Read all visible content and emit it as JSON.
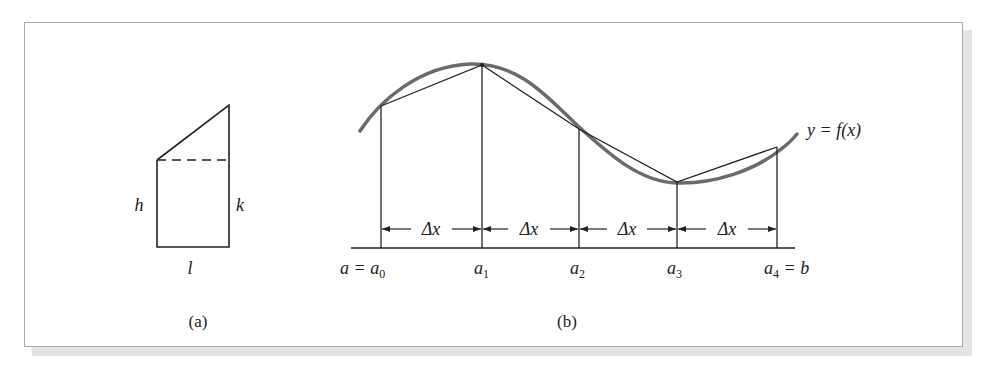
{
  "figure": {
    "panel_a": {
      "caption": "(a)",
      "labels": {
        "left_side": "h",
        "right_side": "k",
        "bottom": "l"
      }
    },
    "panel_b": {
      "caption": "(b)",
      "curve_label": "y = f(x)",
      "interval_label": "Δx",
      "points": [
        {
          "label": "a = a",
          "sub": "0"
        },
        {
          "label": "a",
          "sub": "1"
        },
        {
          "label": "a",
          "sub": "2"
        },
        {
          "label": "a",
          "sub": "3"
        },
        {
          "label": "a",
          "sub": "4",
          "suffix": " = b"
        }
      ],
      "intervals": [
        "Δx",
        "Δx",
        "Δx",
        "Δx"
      ]
    },
    "colors": {
      "ink": "#222222",
      "curve": "#6b6b6b",
      "frame_border": "#a9a9a9",
      "shadow": "#e4e4e4"
    }
  }
}
